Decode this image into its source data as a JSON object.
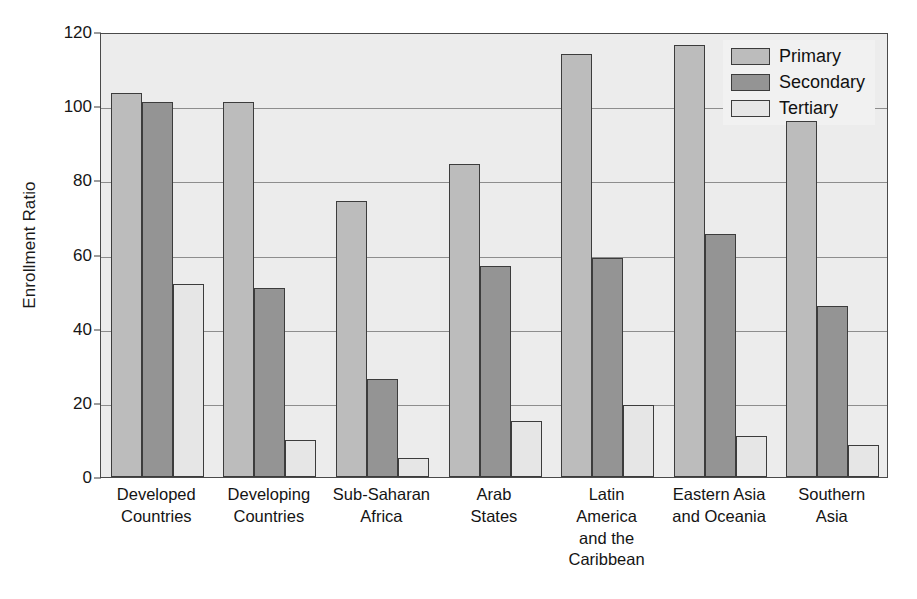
{
  "chart_data": {
    "type": "bar",
    "title": "",
    "xlabel": "",
    "ylabel": "Enrollment Ratio",
    "ylim": [
      0,
      120
    ],
    "ytick_values": [
      0,
      20,
      40,
      60,
      80,
      100,
      120
    ],
    "ytick_labels": [
      "0",
      "20",
      "40",
      "60",
      "80",
      "100",
      "120"
    ],
    "grid": true,
    "grid_orientation": "horizontal",
    "legend_position": "top-right-inside",
    "categories": [
      "Developed Countries",
      "Developing Countries",
      "Sub-Saharan Africa",
      "Arab States",
      "Latin America and the Caribbean",
      "Eastern Asia and Oceania",
      "Southern Asia"
    ],
    "category_lines": [
      [
        "Developed",
        "Countries"
      ],
      [
        "Developing",
        "Countries"
      ],
      [
        "Sub-Saharan",
        "Africa"
      ],
      [
        "Arab",
        "States"
      ],
      [
        "Latin",
        "America",
        "and the",
        "Caribbean"
      ],
      [
        "Eastern Asia",
        "and Oceania"
      ],
      [
        "Southern",
        "Asia"
      ]
    ],
    "series": [
      {
        "name": "Primary",
        "color": "#bcbcbc",
        "values": [
          103.5,
          101.0,
          74.5,
          84.5,
          114.0,
          116.5,
          96.0
        ]
      },
      {
        "name": "Secondary",
        "color": "#949494",
        "values": [
          101.0,
          51.0,
          26.5,
          57.0,
          59.0,
          65.5,
          46.0
        ]
      },
      {
        "name": "Tertiary",
        "color": "#e6e6e6",
        "values": [
          52.0,
          10.0,
          5.0,
          15.0,
          19.5,
          11.0,
          8.5
        ]
      }
    ]
  }
}
